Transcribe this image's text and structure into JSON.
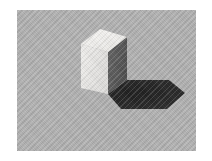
{
  "scene": {
    "title": "Rendered gray cube with cast shadow",
    "description": "A light gray cube resting on a gray ground plane, lit from the upper left, casting a dark shadow to the lower right.",
    "canvas": {
      "width": 212,
      "height": 161
    },
    "frame": {
      "name": "white-border",
      "border_color": "#ffffff",
      "inset_left": 17,
      "inset_top": 10,
      "image_width": 179,
      "image_height": 141
    },
    "background": {
      "label": "ground-plane",
      "color": "#b1b1b1",
      "texture": "diagonal-dither"
    },
    "cube": {
      "label": "cube",
      "top_face": {
        "label": "top-face",
        "color": "#f2f1ef",
        "points": "64,34 91,42 110,27 83,19"
      },
      "left_face": {
        "label": "left-face",
        "color": "#e6e5e3",
        "points": "64,34 91,42 91,84 64,78"
      },
      "right_face": {
        "label": "right-face",
        "color": "#5c5c5c",
        "points": "91,42 110,27 110,70 91,84"
      }
    },
    "shadow": {
      "label": "cast-shadow",
      "color": "#262626",
      "edge_color": "#3a3a3a",
      "points": "91,84 110,70 152,70 168,83 150,99 104,99"
    },
    "lighting": {
      "label": "key-light",
      "direction": "upper-left",
      "highlight_color": "#f6f5f3",
      "shade_color": "#5c5c5c"
    }
  }
}
